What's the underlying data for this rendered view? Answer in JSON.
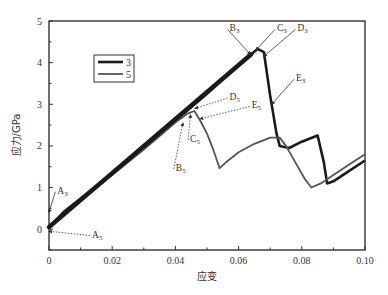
{
  "chart_data": {
    "type": "line",
    "title": "",
    "xlabel": "应变",
    "ylabel": "应力/GPa",
    "xlim": [
      0,
      0.1
    ],
    "ylim": [
      -0.5,
      5
    ],
    "x_ticks": [
      "0",
      "0.02",
      "0.04",
      "0.06",
      "0.08",
      "0.10"
    ],
    "y_ticks": [
      "0",
      "1",
      "2",
      "3",
      "4",
      "5"
    ],
    "grid": false,
    "legend_position": "upper-left",
    "legend": [
      "3",
      "5"
    ],
    "series": [
      {
        "name": "3",
        "color": "#1a1a1a",
        "x": [
          0,
          0.005,
          0.01,
          0.02,
          0.03,
          0.04,
          0.05,
          0.06,
          0.064,
          0.066,
          0.068,
          0.07,
          0.072,
          0.073,
          0.076,
          0.08,
          0.085,
          0.087,
          0.088,
          0.09,
          0.095,
          0.1
        ],
        "y": [
          0.05,
          0.45,
          0.75,
          1.35,
          1.95,
          2.6,
          3.25,
          3.95,
          4.2,
          4.33,
          4.25,
          3.2,
          2.3,
          2.0,
          1.95,
          2.1,
          2.25,
          1.6,
          1.1,
          1.15,
          1.4,
          1.65
        ]
      },
      {
        "name": "5",
        "color": "#555555",
        "x": [
          0,
          0.005,
          0.01,
          0.02,
          0.03,
          0.04,
          0.044,
          0.046,
          0.048,
          0.05,
          0.052,
          0.054,
          0.056,
          0.06,
          0.065,
          0.07,
          0.073,
          0.075,
          0.078,
          0.081,
          0.083,
          0.086,
          0.09,
          0.095,
          0.1
        ],
        "y": [
          0.0,
          0.4,
          0.7,
          1.3,
          1.9,
          2.55,
          2.78,
          2.85,
          2.6,
          2.3,
          1.9,
          1.45,
          1.6,
          1.85,
          2.05,
          2.2,
          2.2,
          2.0,
          1.6,
          1.2,
          1.0,
          1.1,
          1.3,
          1.55,
          1.8
        ]
      }
    ],
    "annotations": [
      {
        "label": "A",
        "sub": "3",
        "x": 0.0,
        "y": 0.4,
        "text_x": 0.002,
        "text_y": 0.85
      },
      {
        "label": "A",
        "sub": "5",
        "x": 0.0,
        "y": -0.05,
        "text_x": 0.013,
        "text_y": -0.2
      },
      {
        "label": "B",
        "sub": "3",
        "x": 0.0637,
        "y": 4.2,
        "text_x": 0.0565,
        "text_y": 4.75
      },
      {
        "label": "C",
        "sub": "3",
        "x": 0.0655,
        "y": 4.3,
        "text_x": 0.0715,
        "text_y": 4.75
      },
      {
        "label": "D",
        "sub": "3",
        "x": 0.068,
        "y": 4.15,
        "text_x": 0.078,
        "text_y": 4.75
      },
      {
        "label": "E",
        "sub": "3",
        "x": 0.0705,
        "y": 3.0,
        "text_x": 0.0775,
        "text_y": 3.55
      },
      {
        "label": "B",
        "sub": "5",
        "x": 0.0424,
        "y": 2.55,
        "text_x": 0.0395,
        "text_y": 1.4
      },
      {
        "label": "C",
        "sub": "5",
        "x": 0.0448,
        "y": 2.75,
        "text_x": 0.044,
        "text_y": 2.1
      },
      {
        "label": "D",
        "sub": "5",
        "x": 0.0462,
        "y": 2.9,
        "text_x": 0.0565,
        "text_y": 3.1
      },
      {
        "label": "E",
        "sub": "5",
        "x": 0.0478,
        "y": 2.65,
        "text_x": 0.0635,
        "text_y": 2.9
      }
    ]
  }
}
